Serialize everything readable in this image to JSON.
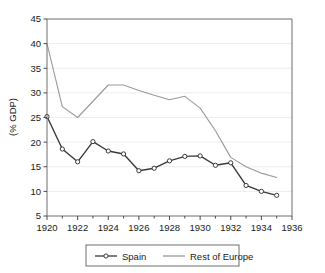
{
  "chart_data": {
    "type": "line",
    "title": "",
    "subtitle": "",
    "xlabel": "",
    "ylabel": "(% GDP)",
    "xlim": [
      1920,
      1936
    ],
    "ylim": [
      5,
      45
    ],
    "ytick_step": 5,
    "xtick_step": 2,
    "xticks": [
      1920,
      1922,
      1924,
      1926,
      1928,
      1930,
      1932,
      1934,
      1936
    ],
    "xtick_labels": [
      "1920",
      "1922",
      "1924",
      "1926",
      "1928",
      "1930",
      "1932",
      "1934",
      "1936"
    ],
    "x_minor_ticks": [
      1921,
      1923,
      1925,
      1927,
      1929,
      1931,
      1933,
      1935
    ],
    "yticks": [
      5,
      10,
      15,
      20,
      25,
      30,
      35,
      40,
      45
    ],
    "ytick_labels": [
      "5",
      "10",
      "15",
      "20",
      "25",
      "30",
      "35",
      "40",
      "45"
    ],
    "grid": true,
    "grid_axis": "y",
    "legend_position": "below",
    "x": [
      1920,
      1921,
      1922,
      1923,
      1924,
      1925,
      1926,
      1927,
      1928,
      1929,
      1930,
      1931,
      1932,
      1933,
      1934,
      1935
    ],
    "series": [
      {
        "name": "Spain",
        "color": "#3a3a3a",
        "marker": "open-circle",
        "marker_fill": "#ffffff",
        "values": [
          25.2,
          18.6,
          16.0,
          20.1,
          18.2,
          17.6,
          14.2,
          14.7,
          16.2,
          17.1,
          17.2,
          15.3,
          15.8,
          11.2,
          10.0,
          9.2
        ]
      },
      {
        "name": "Rest of Europe",
        "color": "#9a9a9a",
        "marker": "none",
        "marker_fill": "",
        "values": [
          40.0,
          27.2,
          25.0,
          28.3,
          31.6,
          31.6,
          30.5,
          29.5,
          28.6,
          29.3,
          26.9,
          22.3,
          16.9,
          15.0,
          13.7,
          12.8
        ]
      }
    ]
  },
  "legend": {
    "items": [
      {
        "label": "Spain"
      },
      {
        "label": "Rest of Europe"
      }
    ]
  },
  "axes": {
    "y_axis_title": "(% GDP)"
  }
}
